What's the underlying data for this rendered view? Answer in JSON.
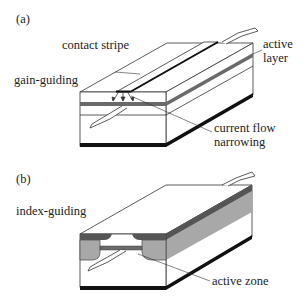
{
  "figure": {
    "panel_a": {
      "tag": "(a)",
      "title": "gain-guiding",
      "labels": {
        "contact_stripe": "contact stripe",
        "active_layer_1": "active",
        "active_layer_2": "layer",
        "current_flow_1": "current flow",
        "current_flow_2": "narrowing"
      }
    },
    "panel_b": {
      "tag": "(b)",
      "title": "index-guiding",
      "labels": {
        "active_zone": "active zone"
      }
    },
    "colors": {
      "active_layer": "#6a6a6a",
      "cladding_gray": "#a8a8a8",
      "outline": "#333333",
      "substrate_contact": "#111111"
    }
  }
}
